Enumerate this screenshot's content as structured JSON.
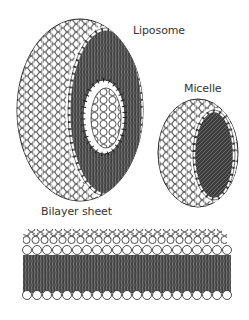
{
  "labels": {
    "liposome": "Liposome",
    "micelle": "Micelle",
    "bilayer": "Bilayer sheet"
  },
  "structures": [
    {
      "name": "liposome",
      "shape": "hollow sphere (cut-away)",
      "head_color": "#ffffff",
      "tail_color": "#3a3a3a"
    },
    {
      "name": "micelle",
      "shape": "solid sphere (cut-away)",
      "head_color": "#ffffff",
      "tail_color": "#3a3a3a"
    },
    {
      "name": "bilayer-sheet",
      "shape": "flat double layer",
      "head_color": "#ffffff",
      "tail_color": "#3a3a3a"
    }
  ],
  "colors": {
    "outline": "#222222",
    "tails": "#3a3a3a",
    "heads": "#ffffff",
    "background": "#ffffff"
  }
}
